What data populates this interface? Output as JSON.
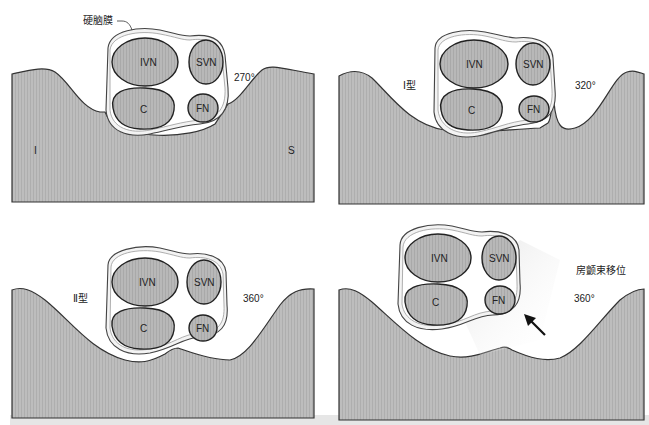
{
  "figure": {
    "panels": [
      {
        "id": "top-left",
        "angle": "270°",
        "type_label": "",
        "side_labels": {
          "left": "I",
          "right": "S"
        },
        "annotation": "硬脑膜",
        "structures": [
          "IVN",
          "SVN",
          "C",
          "FN"
        ]
      },
      {
        "id": "top-right",
        "angle": "320°",
        "type_label": "Ⅰ型",
        "structures": [
          "IVN",
          "SVN",
          "C",
          "FN"
        ]
      },
      {
        "id": "bottom-left",
        "angle": "360°",
        "type_label": "Ⅱ型",
        "structures": [
          "IVN",
          "SVN",
          "C",
          "FN"
        ]
      },
      {
        "id": "bottom-right",
        "angle": "360°",
        "type_label": "房颤束移位",
        "structures": [
          "IVN",
          "SVN",
          "C",
          "FN"
        ],
        "arrow": "arrow-pointing-up-left"
      }
    ],
    "colors": {
      "bone": "#b9b9b9",
      "nerve": "#b3b3b3",
      "dura": "#f3f3f3",
      "outline": "#333333"
    }
  }
}
